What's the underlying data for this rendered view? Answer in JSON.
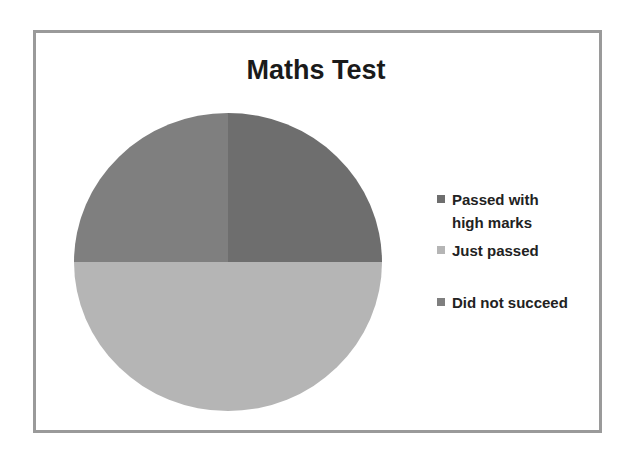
{
  "chart": {
    "title": "Maths Test",
    "legend": [
      {
        "label": "Passed with high marks",
        "color": "#6e6e6e"
      },
      {
        "label": "Just passed",
        "color": "#b5b5b5"
      },
      {
        "label": "Did not succeed",
        "color": "#7f7f7f"
      }
    ]
  },
  "chart_data": {
    "type": "pie",
    "title": "Maths Test",
    "categories": [
      "Passed with high marks",
      "Just passed",
      "Did not succeed"
    ],
    "values": [
      25,
      50,
      25
    ],
    "colors": [
      "#6e6e6e",
      "#b5b5b5",
      "#7f7f7f"
    ],
    "start_angle": "12 o'clock",
    "direction": "clockwise",
    "legend_position": "right",
    "xlabel": "",
    "ylabel": ""
  }
}
